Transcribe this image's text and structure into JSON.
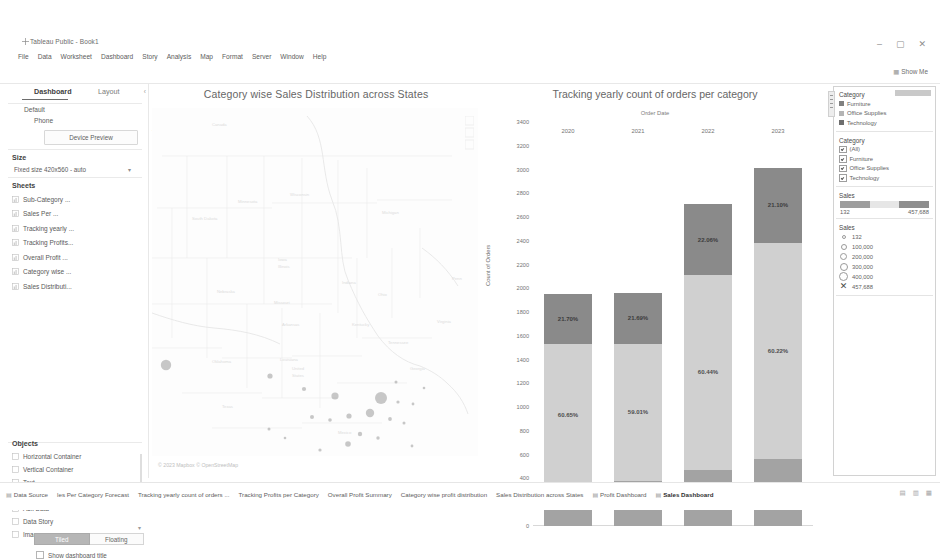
{
  "window": {
    "title": "Tableau Public - Book1",
    "app_icon": "tableau-icon",
    "minimize": "–",
    "maximize": "▢",
    "close": "✕"
  },
  "menu": {
    "items": [
      "File",
      "Data",
      "Worksheet",
      "Dashboard",
      "Story",
      "Analysis",
      "Map",
      "Format",
      "Server",
      "Window",
      "Help"
    ]
  },
  "toolbar": {
    "show_me": "Show Me",
    "show_me_icon": "show-me-icon",
    "icons": [
      "tableau-home-icon",
      "back-arrow-icon",
      "forward-arrow-icon",
      "undo-icon",
      "save-icon",
      "new-data-source-icon",
      "new-worksheet-icon",
      "duplicate-icon",
      "clear-sheet-icon",
      "refresh-icon",
      "pause-icon",
      "swap-icon",
      "sort-asc-icon",
      "sort-desc-icon",
      "highlight-icon",
      "group-icon",
      "fit-icon",
      "show-labels-icon",
      "presentation-icon",
      "fit-dropdown-icon",
      "device-preview-icon"
    ]
  },
  "left_panel": {
    "tab_dashboard": "Dashboard",
    "tab_layout": "Layout",
    "collapse_icon": "chevron-left-icon",
    "device_default": "Default",
    "device_phone": "Phone",
    "device_preview_button": "Device Preview",
    "size_heading": "Size",
    "size_value": "Fixed size 420x560 - auto",
    "size_caret": "▾",
    "sheets_heading": "Sheets",
    "sheets": [
      {
        "label": "Sub-Category ...",
        "icon": "bar-chart-icon"
      },
      {
        "label": "Sales Per ...",
        "icon": "line-chart-icon"
      },
      {
        "label": "Tracking yearly ...",
        "icon": "stacked-bar-icon"
      },
      {
        "label": "Tracking Profits...",
        "icon": "area-chart-icon"
      },
      {
        "label": "Overall Profit ...",
        "icon": "table-icon"
      },
      {
        "label": "Category wise ...",
        "icon": "bar-chart-icon"
      },
      {
        "label": "Sales Distributi...",
        "icon": "map-icon"
      }
    ],
    "objects_heading": "Objects",
    "objects": [
      {
        "label": "Horizontal Container",
        "icon": "horizontal-container-icon"
      },
      {
        "label": "Vertical Container",
        "icon": "vertical-container-icon"
      },
      {
        "label": "Text",
        "icon": "text-icon"
      },
      {
        "label": "Extension",
        "icon": "extension-icon"
      },
      {
        "label": "Ask Data",
        "icon": "ask-data-icon"
      },
      {
        "label": "Data Story",
        "icon": "data-story-icon"
      },
      {
        "label": "Image",
        "icon": "image-icon"
      }
    ],
    "objects_caret": "▾",
    "tiled_label": "Tiled",
    "floating_label": "Floating",
    "show_dashboard_title": "Show dashboard title"
  },
  "map_panel": {
    "title": "Category wise Sales Distribution across States",
    "attribution": "© 2023 Mapbox © OpenStreetMap"
  },
  "filters": {
    "legend_title": "Category",
    "legend_items": [
      {
        "label": "Furniture",
        "color": "#808080"
      },
      {
        "label": "Office Supplies",
        "color": "#b4b4b4"
      },
      {
        "label": "Technology",
        "color": "#6e6e6e"
      }
    ],
    "filter_title": "Category",
    "filter_items": [
      {
        "label": "(All)",
        "checked": true
      },
      {
        "label": "Furniture",
        "checked": true
      },
      {
        "label": "Office Supplies",
        "checked": true
      },
      {
        "label": "Technology",
        "checked": true
      }
    ],
    "sales_range_title": "Sales",
    "sales_range_min": "132",
    "sales_range_max": "457,688",
    "sales_size_title": "Sales",
    "sales_size_items": [
      {
        "label": "132",
        "dot": 2
      },
      {
        "label": "100,000",
        "dot": 4
      },
      {
        "label": "200,000",
        "dot": 5
      },
      {
        "label": "300,000",
        "dot": 6
      },
      {
        "label": "400,000",
        "dot": 7
      },
      {
        "label": "457,688",
        "dot": 8
      }
    ],
    "remove_icon": "✕"
  },
  "bottom": {
    "tabs": [
      {
        "label": "Data Source",
        "icon": "data-source-icon",
        "active": false
      },
      {
        "label": "les Per Category Forecast",
        "icon": "",
        "active": false
      },
      {
        "label": "Tracking yearly count of orders ...",
        "icon": "",
        "active": false
      },
      {
        "label": "Tracking Profits per Category",
        "icon": "",
        "active": false
      },
      {
        "label": "Overall Profit Summary",
        "icon": "",
        "active": false
      },
      {
        "label": "Category wise profit distribution",
        "icon": "",
        "active": false
      },
      {
        "label": "Sales Distribution across States",
        "icon": "",
        "active": false
      },
      {
        "label": "Profit Dashboard",
        "icon": "dashboard-icon",
        "active": false
      },
      {
        "label": "Sales Dashboard",
        "icon": "dashboard-icon",
        "active": true
      }
    ],
    "new_buttons": [
      "new-worksheet-icon",
      "new-dashboard-icon",
      "new-story-icon"
    ]
  },
  "chart_data": {
    "type": "bar",
    "title": "Tracking yearly count of orders per category",
    "subtitle": "Order Date",
    "xlabel": "",
    "ylabel": "Count of Orders",
    "ylim": [
      0,
      3400
    ],
    "ytick_step": 200,
    "yticks": [
      "0",
      "200",
      "400",
      "600",
      "800",
      "1000",
      "1200",
      "1400",
      "1600",
      "1800",
      "2000",
      "2200",
      "2400",
      "2600",
      "2800",
      "3000",
      "3200",
      "3400"
    ],
    "categories": [
      "2020",
      "2021",
      "2022",
      "2023"
    ],
    "stacked": true,
    "legend_position": "right",
    "grid": false,
    "series": [
      {
        "name": "Furniture",
        "color": "#a3a3a3",
        "values": [
          345,
          378,
          474,
          563
        ],
        "labels": [
          "17.65%",
          "19.30%",
          "17.50%",
          "18.67%"
        ]
      },
      {
        "name": "Office Supplies",
        "color": "#d0d0d0",
        "values": [
          1186,
          1156,
          1637,
          1817
        ],
        "labels": [
          "60.65%",
          "59.01%",
          "60.44%",
          "60.22%"
        ]
      },
      {
        "name": "Technology",
        "color": "#8a8a8a",
        "values": [
          424,
          425,
          597,
          637
        ],
        "labels": [
          "21.70%",
          "21.69%",
          "22.06%",
          "21.10%"
        ]
      }
    ],
    "totals": [
      1955,
      1959,
      2708,
      3017
    ]
  }
}
